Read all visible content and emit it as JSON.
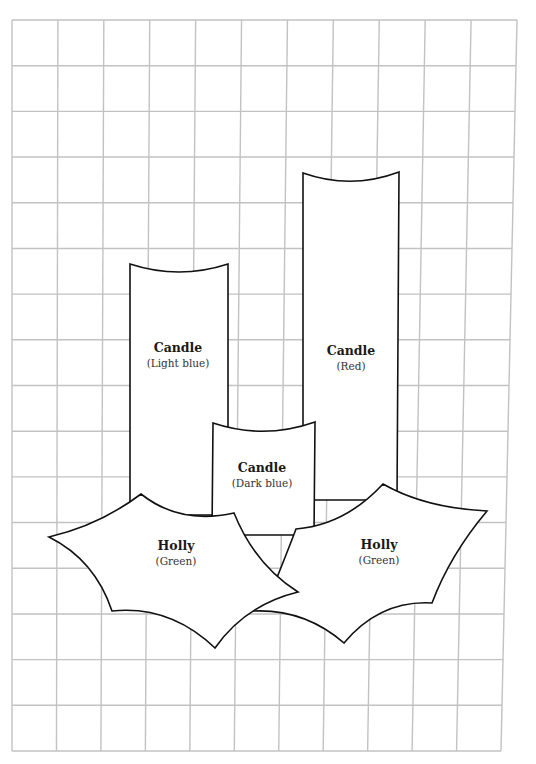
{
  "grid": {
    "columns": 11,
    "rows": 16,
    "line_color": "#c2c2c2",
    "corners": {
      "top_left": [
        12,
        20
      ],
      "top_right": [
        517,
        20
      ],
      "bottom_left": [
        12,
        751
      ],
      "bottom_right": [
        501,
        751
      ]
    }
  },
  "pieces": [
    {
      "id": "candle-red",
      "shape": "Candle",
      "color": "Red",
      "title": "Candle",
      "subtitle": "(Red)",
      "label_pos": [
        351,
        345
      ]
    },
    {
      "id": "candle-light-blue",
      "shape": "Candle",
      "color": "Light blue",
      "title": "Candle",
      "subtitle": "(Light blue)",
      "label_pos": [
        178,
        342
      ]
    },
    {
      "id": "candle-dark-blue",
      "shape": "Candle",
      "color": "Dark blue",
      "title": "Candle",
      "subtitle": "(Dark blue)",
      "label_pos": [
        262,
        462
      ]
    },
    {
      "id": "holly-right",
      "shape": "Holly",
      "color": "Green",
      "title": "Holly",
      "subtitle": "(Green)",
      "label_pos": [
        379,
        539
      ]
    },
    {
      "id": "holly-left",
      "shape": "Holly",
      "color": "Green",
      "title": "Holly",
      "subtitle": "(Green)",
      "label_pos": [
        176,
        540
      ]
    }
  ],
  "footer": {
    "page_number": "41"
  }
}
